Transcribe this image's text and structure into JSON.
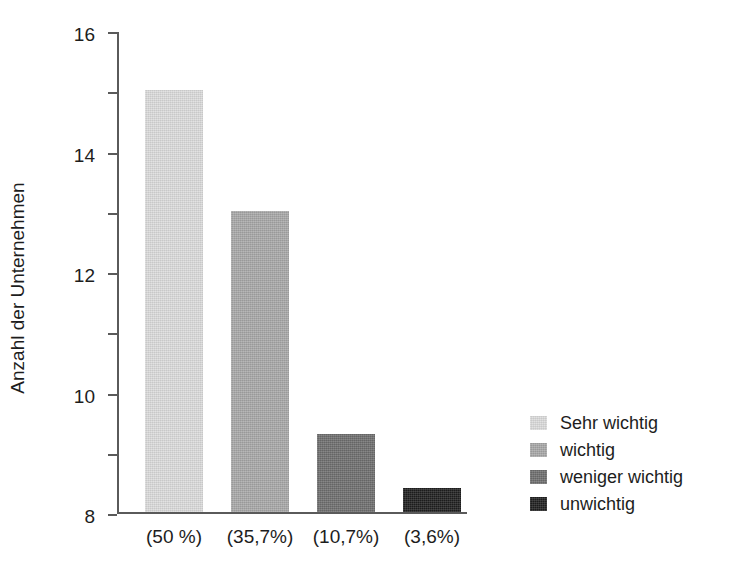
{
  "chart_data": {
    "type": "bar",
    "title": "",
    "xlabel": "",
    "ylabel": "Anzahl der Unternehmen",
    "categories": [
      "(50 %)",
      "(35,7%)",
      "(10,7%)",
      "(3,6%)"
    ],
    "values": [
      14,
      10,
      2.6,
      0.8
    ],
    "series": [
      {
        "name": "Anzahl der Unternehmen",
        "values": [
          14,
          10,
          2.6,
          0.8
        ]
      }
    ],
    "bar_labels": [
      "Sehr wichtig",
      "wichtig",
      "weniger wichtig",
      "unwichtig"
    ],
    "bar_colors": [
      "#dcdcdc",
      "#a8a8a8",
      "#6e6e6e",
      "#1f1f1f"
    ],
    "ylim": [
      0,
      16
    ],
    "yticks": [
      0,
      2,
      4,
      6,
      8,
      10,
      12,
      14,
      16
    ],
    "ytick_labels": [
      "0",
      "2",
      "4",
      "6",
      "8",
      "10",
      "12",
      "14",
      "16"
    ],
    "grid": false,
    "legend_position": "right"
  },
  "legend": {
    "items": [
      {
        "label": "Sehr wichtig",
        "color": "#dcdcdc"
      },
      {
        "label": "wichtig",
        "color": "#a8a8a8"
      },
      {
        "label": "weniger wichtig",
        "color": "#6e6e6e"
      },
      {
        "label": "unwichtig",
        "color": "#1f1f1f"
      }
    ]
  },
  "axes": {
    "y_title": "Anzahl der Unternehmen",
    "axis_color": "#5a5a5a"
  }
}
